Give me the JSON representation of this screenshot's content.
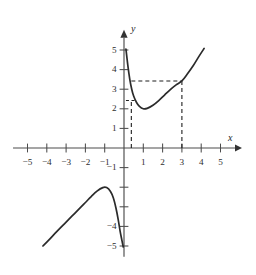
{
  "figure": {
    "background_color": "#ffffff",
    "curve_color": "#2b2b2b",
    "axis_color": "#4c4c4c",
    "guide_color": "#1f1f1f"
  },
  "axes": {
    "x_label": "x",
    "y_label": "y",
    "x_ticks": [
      {
        "value": -5,
        "label": "−5"
      },
      {
        "value": -4,
        "label": "−4"
      },
      {
        "value": -3,
        "label": "−3"
      },
      {
        "value": -2,
        "label": "−2"
      },
      {
        "value": -1,
        "label": "−1"
      },
      {
        "value": 1,
        "label": "1"
      },
      {
        "value": 2,
        "label": "2"
      },
      {
        "value": 3,
        "label": "3"
      },
      {
        "value": 4,
        "label": "4"
      },
      {
        "value": 5,
        "label": "5"
      }
    ],
    "y_ticks": [
      {
        "value": 5,
        "label": "5"
      },
      {
        "value": 4,
        "label": "4"
      },
      {
        "value": 3,
        "label": "3"
      },
      {
        "value": 2,
        "label": "2"
      },
      {
        "value": 1,
        "label": "1"
      },
      {
        "value": -1,
        "label": "−1"
      },
      {
        "value": -2,
        "label": ""
      },
      {
        "value": -3,
        "label": ""
      },
      {
        "value": -4,
        "label": "−4"
      },
      {
        "value": -5,
        "label": "−5"
      }
    ],
    "x_range": [
      -5.8,
      5.8
    ],
    "y_range": [
      -5.4,
      5.4
    ],
    "grid": false
  },
  "chart_data": {
    "type": "line",
    "title": "",
    "xlabel": "x",
    "ylabel": "y",
    "xlim": [
      -5.8,
      5.8
    ],
    "ylim": [
      -5.4,
      5.4
    ],
    "grid": false,
    "legend": "none",
    "series": [
      {
        "name": "upper-branch",
        "comment": "Right branch: falls from y=5 near x=0.1, minimum at (1, 2), rises to (4.2, 5.1)",
        "points": [
          [
            0.1,
            5.05
          ],
          [
            0.2,
            4.2
          ],
          [
            0.3,
            3.5
          ],
          [
            0.4,
            3.0
          ],
          [
            0.5,
            2.65
          ],
          [
            0.65,
            2.32
          ],
          [
            0.8,
            2.12
          ],
          [
            1.0,
            2.0
          ],
          [
            1.2,
            2.02
          ],
          [
            1.5,
            2.18
          ],
          [
            1.8,
            2.42
          ],
          [
            2.1,
            2.7
          ],
          [
            2.4,
            2.98
          ],
          [
            2.7,
            3.22
          ],
          [
            3.0,
            3.42
          ],
          [
            3.3,
            3.8
          ],
          [
            3.6,
            4.22
          ],
          [
            3.9,
            4.7
          ],
          [
            4.15,
            5.08
          ]
        ]
      },
      {
        "name": "lower-branch",
        "comment": "Left branch: rises from (-4.2, -5.0), peak at (-1.05, -2.0), plunges to (-0.05, -5.0)",
        "points": [
          [
            -4.2,
            -5.0
          ],
          [
            -3.9,
            -4.7
          ],
          [
            -3.5,
            -4.28
          ],
          [
            -3.1,
            -3.88
          ],
          [
            -2.7,
            -3.48
          ],
          [
            -2.3,
            -3.08
          ],
          [
            -2.0,
            -2.78
          ],
          [
            -1.7,
            -2.48
          ],
          [
            -1.4,
            -2.2
          ],
          [
            -1.1,
            -2.02
          ],
          [
            -0.9,
            -2.02
          ],
          [
            -0.7,
            -2.22
          ],
          [
            -0.55,
            -2.55
          ],
          [
            -0.42,
            -3.05
          ],
          [
            -0.3,
            -3.65
          ],
          [
            -0.2,
            -4.25
          ],
          [
            -0.1,
            -4.75
          ],
          [
            -0.04,
            -5.05
          ]
        ]
      }
    ],
    "annotations": [
      {
        "name": "horizontal-guide-upper",
        "type": "dashed-horizontal",
        "y": 3.42,
        "x_start": 0.38,
        "x_end": 3.0
      },
      {
        "name": "vertical-guide-right",
        "type": "dashed-vertical",
        "x": 3.0,
        "y_start": 0,
        "y_end": 3.42
      },
      {
        "name": "horizontal-guide-lower",
        "type": "dashed-horizontal",
        "y": 2.42,
        "x_start": 0.1,
        "x_end": 0.55
      },
      {
        "name": "vertical-guide-left",
        "type": "dashed-vertical",
        "x": 0.38,
        "y_start": 0,
        "y_end": 2.42
      }
    ],
    "marked_points": [
      {
        "x": 3.0,
        "y": 3.42,
        "label": ""
      },
      {
        "x": 0.38,
        "y": 2.42,
        "label": ""
      }
    ]
  }
}
